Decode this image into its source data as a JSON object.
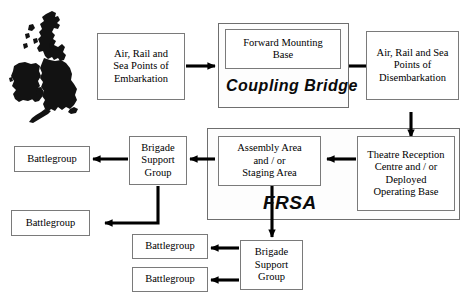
{
  "diagram": {
    "background_color": "#ffffff",
    "line_color": "#000000",
    "box_border_color": "#7a7a7a",
    "nodes": [
      {
        "id": "embarkation",
        "label": "Air, Rail and\nSea Points of\nEmbarkation"
      },
      {
        "id": "fmb",
        "label": "Forward Mounting\nBase"
      },
      {
        "id": "disembarkation",
        "label": "Air, Rail and Sea\nPoints of\nDisembarkation"
      },
      {
        "id": "assembly",
        "label": "Assembly Area\nand / or\nStaging Area"
      },
      {
        "id": "theatre",
        "label": "Theatre Reception\nCentre and / or\nDeployed\nOperating Base"
      },
      {
        "id": "bsg-upper",
        "label": "Brigade\nSupport\nGroup"
      },
      {
        "id": "bsg-lower",
        "label": "Brigade\nSupport\nGroup"
      },
      {
        "id": "bg-1",
        "label": "Battlegroup"
      },
      {
        "id": "bg-2",
        "label": "Battlegroup"
      },
      {
        "id": "bg-3",
        "label": "Battlegroup"
      },
      {
        "id": "bg-4",
        "label": "Battlegroup"
      }
    ],
    "group_labels": [
      {
        "id": "coupling-bridge",
        "label": "Coupling Bridge"
      },
      {
        "id": "frsa",
        "label": "FRSA"
      }
    ],
    "map": {
      "name": "uk-ireland-map",
      "fill": "#121212"
    }
  }
}
